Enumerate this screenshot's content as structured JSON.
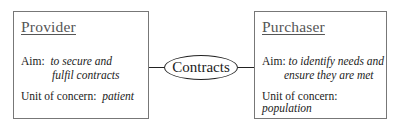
{
  "provider": {
    "title": "Provider",
    "aim_label": "Aim:",
    "aim_line1": "to secure and",
    "aim_line2": "fulfil contracts",
    "unit_label": "Unit of concern:",
    "unit_value": "patient"
  },
  "connector": {
    "label": "Contracts"
  },
  "purchaser": {
    "title": "Purchaser",
    "aim_label": "Aim:",
    "aim_line1": "to identify needs and",
    "aim_line2": "ensure they are met",
    "unit_label": "Unit of concern:",
    "unit_value": "population"
  }
}
